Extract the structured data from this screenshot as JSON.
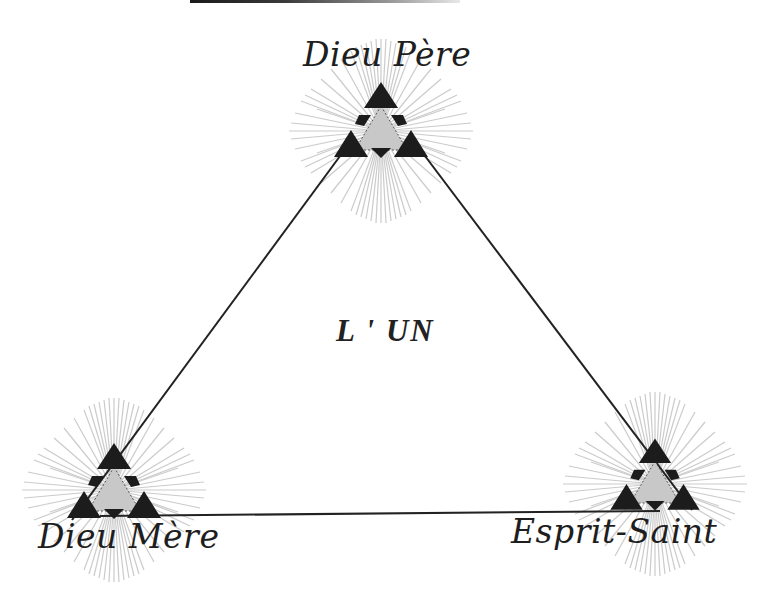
{
  "diagram": {
    "center_label": "L ' UN",
    "nodes": [
      {
        "id": "pere",
        "label": "Dieu Père",
        "position": "top"
      },
      {
        "id": "mere",
        "label": "Dieu Mère",
        "position": "bottom-left"
      },
      {
        "id": "esprit",
        "label": "Esprit-Saint",
        "position": "bottom-right"
      }
    ],
    "edges": [
      {
        "from": "pere",
        "to": "mere"
      },
      {
        "from": "pere",
        "to": "esprit"
      },
      {
        "from": "mere",
        "to": "esprit"
      }
    ],
    "emblem_icon": "radiant-triangle-icon"
  },
  "colors": {
    "line": "#222222",
    "emblem_dark": "#1c1c1c",
    "emblem_fill": "#c8c8c8",
    "rays": "#c9c9c9",
    "text": "#1e1e1e"
  }
}
